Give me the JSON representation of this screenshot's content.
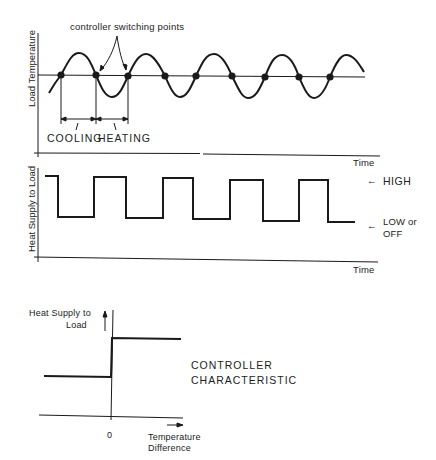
{
  "top_plot": {
    "y_label": "Load Temperature",
    "x_label": "Time",
    "annotation": "controller switching points",
    "interval_labels": [
      "COOLING",
      "HEATING"
    ],
    "switching_point_x": [
      61,
      96,
      128,
      165,
      196,
      232,
      265,
      299,
      330
    ]
  },
  "middle_plot": {
    "y_label": "Heat Supply to Load",
    "x_label": "Time",
    "level_high": "HIGH",
    "level_low_line1": "LOW or",
    "level_low_line2": "OFF",
    "arrow_glyph": "←"
  },
  "bottom_plot": {
    "y_label_line1": "Heat Supply to",
    "y_label_line2": "Load",
    "x_label_line1": "Temperature",
    "x_label_line2": "Difference",
    "origin_tick": "0",
    "title_line1": "CONTROLLER",
    "title_line2": "CHARACTERISTIC"
  },
  "colors": {
    "ink": "#1a1a1a",
    "background": "#ffffff"
  }
}
